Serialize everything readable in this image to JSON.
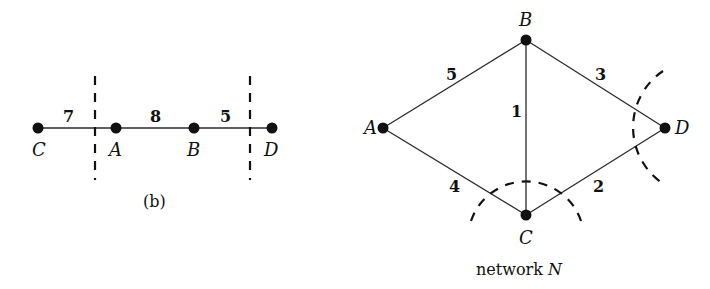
{
  "figure_b": {
    "caption": "(b)",
    "vertices": [
      {
        "label": "C",
        "x": 38,
        "y": 128
      },
      {
        "label": "A",
        "x": 116,
        "y": 128
      },
      {
        "label": "B",
        "x": 194,
        "y": 128
      },
      {
        "label": "D",
        "x": 272,
        "y": 128
      }
    ],
    "edges": [
      {
        "from": "C",
        "to": "A",
        "weight": "7"
      },
      {
        "from": "A",
        "to": "B",
        "weight": "8"
      },
      {
        "from": "B",
        "to": "D",
        "weight": "5"
      }
    ],
    "cuts": [
      {
        "type": "vertical-dashed",
        "x": 95,
        "y1": 75,
        "y2": 180
      },
      {
        "type": "vertical-dashed",
        "x": 250,
        "y1": 75,
        "y2": 180
      }
    ]
  },
  "network": {
    "caption_prefix": "network ",
    "caption_var": "N",
    "vertices": [
      {
        "label": "A",
        "x": 383,
        "y": 128
      },
      {
        "label": "B",
        "x": 526,
        "y": 40
      },
      {
        "label": "C",
        "x": 526,
        "y": 215
      },
      {
        "label": "D",
        "x": 665,
        "y": 128
      }
    ],
    "edges": [
      {
        "from": "A",
        "to": "B",
        "weight": "5"
      },
      {
        "from": "B",
        "to": "D",
        "weight": "3"
      },
      {
        "from": "B",
        "to": "C",
        "weight": "1"
      },
      {
        "from": "A",
        "to": "C",
        "weight": "4"
      },
      {
        "from": "C",
        "to": "D",
        "weight": "2"
      }
    ],
    "cuts": [
      {
        "type": "dashed-arc",
        "around": "C"
      },
      {
        "type": "dashed-arc",
        "around": "D"
      }
    ]
  }
}
